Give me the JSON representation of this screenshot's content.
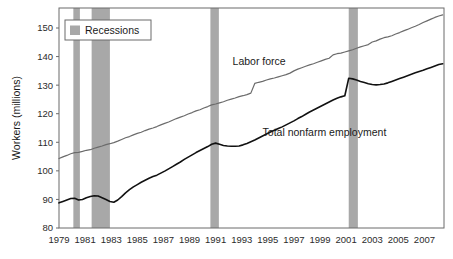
{
  "chart_data": {
    "type": "line",
    "title": "",
    "xlabel": "",
    "ylabel": "Workers (millions)",
    "xlim": [
      1979,
      2008.5
    ],
    "ylim": [
      80,
      157
    ],
    "grid": false,
    "legend_position": "top-left",
    "x_ticks": [
      "1979",
      "1981",
      "1983",
      "1985",
      "1987",
      "1989",
      "1991",
      "1993",
      "1995",
      "1997",
      "1999",
      "2001",
      "2003",
      "2005",
      "2007"
    ],
    "x_tick_values": [
      1979,
      1981,
      1983,
      1985,
      1987,
      1989,
      1991,
      1993,
      1995,
      1997,
      1999,
      2001,
      2003,
      2005,
      2007
    ],
    "y_ticks": [
      "80",
      "90",
      "100",
      "110",
      "120",
      "130",
      "140",
      "150"
    ],
    "y_tick_values": [
      80,
      90,
      100,
      110,
      120,
      130,
      140,
      150
    ],
    "legend": [
      {
        "label": "Recessions",
        "color": "#a8a8a8",
        "swatch": "band"
      }
    ],
    "annotations": [
      {
        "text": "Labor force",
        "x": 1992.3,
        "y": 137.0,
        "anchor": "start"
      },
      {
        "text": "Total nonfarm employment",
        "x": 1994.6,
        "y": 112.2,
        "anchor": "start"
      }
    ],
    "recession_bands": [
      {
        "start": 1980.1,
        "end": 1980.6
      },
      {
        "start": 1981.5,
        "end": 1982.9
      },
      {
        "start": 1990.6,
        "end": 1991.25
      },
      {
        "start": 2001.2,
        "end": 2001.9
      }
    ],
    "series": [
      {
        "name": "Labor force",
        "color": "#6b6b6b",
        "width": 1.2,
        "x": [
          1979.0,
          1979.3,
          1979.6,
          1979.9,
          1980.2,
          1980.5,
          1980.8,
          1981.1,
          1981.4,
          1981.7,
          1982.0,
          1982.3,
          1982.6,
          1982.9,
          1983.2,
          1983.5,
          1983.8,
          1984.1,
          1984.4,
          1984.7,
          1985.0,
          1985.3,
          1985.6,
          1985.9,
          1986.2,
          1986.5,
          1986.8,
          1987.1,
          1987.4,
          1987.7,
          1988.0,
          1988.3,
          1988.6,
          1988.9,
          1989.2,
          1989.5,
          1989.8,
          1990.1,
          1990.4,
          1990.7,
          1991.0,
          1991.3,
          1991.6,
          1991.9,
          1992.2,
          1992.5,
          1992.8,
          1993.1,
          1993.4,
          1993.7,
          1994.0,
          1994.3,
          1994.6,
          1994.9,
          1995.2,
          1995.5,
          1995.8,
          1996.1,
          1996.4,
          1996.7,
          1997.0,
          1997.3,
          1997.6,
          1997.9,
          1998.2,
          1998.5,
          1998.8,
          1999.1,
          1999.4,
          1999.7,
          2000.0,
          2000.3,
          2000.6,
          2000.9,
          2001.2,
          2001.5,
          2001.8,
          2002.1,
          2002.4,
          2002.7,
          2003.0,
          2003.3,
          2003.6,
          2003.9,
          2004.2,
          2004.5,
          2004.8,
          2005.1,
          2005.4,
          2005.7,
          2006.0,
          2006.3,
          2006.6,
          2006.9,
          2007.2,
          2007.5,
          2007.8,
          2008.1,
          2008.4
        ],
        "y": [
          104.3,
          104.9,
          105.4,
          106.0,
          106.4,
          106.5,
          106.8,
          107.2,
          107.4,
          107.9,
          108.3,
          108.7,
          109.2,
          109.5,
          109.9,
          110.4,
          111.0,
          111.6,
          112.0,
          112.6,
          113.1,
          113.5,
          114.1,
          114.6,
          115.0,
          115.5,
          116.1,
          116.6,
          117.1,
          117.7,
          118.3,
          118.8,
          119.3,
          119.9,
          120.4,
          121.0,
          121.4,
          122.0,
          122.5,
          123.1,
          123.4,
          123.8,
          124.2,
          124.7,
          125.1,
          125.5,
          126.0,
          126.3,
          126.7,
          127.2,
          130.6,
          131.0,
          131.3,
          131.8,
          132.2,
          132.5,
          132.9,
          133.3,
          133.7,
          134.2,
          135.0,
          135.6,
          136.1,
          136.6,
          137.1,
          137.5,
          138.0,
          138.5,
          139.0,
          139.4,
          140.6,
          141.0,
          141.2,
          141.6,
          142.0,
          142.4,
          142.9,
          143.4,
          143.8,
          144.2,
          145.1,
          145.5,
          146.1,
          146.6,
          146.9,
          147.3,
          147.9,
          148.4,
          149.0,
          149.5,
          150.1,
          150.6,
          151.2,
          151.9,
          152.5,
          153.1,
          153.7,
          154.2,
          154.6
        ]
      },
      {
        "name": "Total nonfarm employment",
        "color": "#111111",
        "width": 1.6,
        "x": [
          1979.0,
          1979.3,
          1979.6,
          1979.9,
          1980.2,
          1980.5,
          1980.8,
          1981.1,
          1981.4,
          1981.7,
          1982.0,
          1982.3,
          1982.6,
          1982.9,
          1983.2,
          1983.5,
          1983.8,
          1984.1,
          1984.4,
          1984.7,
          1985.0,
          1985.3,
          1985.6,
          1985.9,
          1986.2,
          1986.5,
          1986.8,
          1987.1,
          1987.4,
          1987.7,
          1988.0,
          1988.3,
          1988.6,
          1988.9,
          1989.2,
          1989.5,
          1989.8,
          1990.1,
          1990.4,
          1990.7,
          1991.0,
          1991.3,
          1991.6,
          1991.9,
          1992.2,
          1992.5,
          1992.8,
          1993.1,
          1993.4,
          1993.7,
          1994.0,
          1994.3,
          1994.6,
          1994.9,
          1995.2,
          1995.5,
          1995.8,
          1996.1,
          1996.4,
          1996.7,
          1997.0,
          1997.3,
          1997.6,
          1997.9,
          1998.2,
          1998.5,
          1998.8,
          1999.1,
          1999.4,
          1999.7,
          2000.0,
          2000.3,
          2000.6,
          2000.9,
          2001.2,
          2001.5,
          2001.8,
          2002.1,
          2002.4,
          2002.7,
          2003.0,
          2003.3,
          2003.6,
          2003.9,
          2004.2,
          2004.5,
          2004.8,
          2005.1,
          2005.4,
          2005.7,
          2006.0,
          2006.3,
          2006.6,
          2006.9,
          2007.2,
          2007.5,
          2007.8,
          2008.1,
          2008.4
        ],
        "y": [
          88.8,
          89.3,
          89.8,
          90.3,
          90.4,
          89.8,
          90.0,
          90.6,
          91.0,
          91.3,
          91.2,
          90.6,
          90.0,
          89.3,
          89.0,
          89.8,
          91.0,
          92.3,
          93.4,
          94.4,
          95.2,
          96.0,
          96.7,
          97.4,
          98.0,
          98.5,
          99.2,
          99.9,
          100.7,
          101.5,
          102.3,
          103.1,
          104.0,
          104.8,
          105.6,
          106.4,
          107.1,
          107.8,
          108.5,
          109.3,
          109.7,
          109.3,
          108.9,
          108.7,
          108.6,
          108.6,
          108.7,
          109.1,
          109.6,
          110.2,
          110.8,
          111.5,
          112.2,
          112.9,
          113.6,
          114.2,
          114.8,
          115.4,
          116.1,
          116.8,
          117.5,
          118.3,
          119.0,
          119.8,
          120.6,
          121.3,
          122.0,
          122.7,
          123.4,
          124.1,
          124.8,
          125.4,
          125.9,
          126.3,
          132.4,
          132.2,
          131.8,
          131.3,
          130.9,
          130.5,
          130.2,
          130.1,
          130.2,
          130.4,
          130.8,
          131.3,
          131.8,
          132.3,
          132.8,
          133.3,
          133.8,
          134.3,
          134.8,
          135.2,
          135.7,
          136.2,
          136.7,
          137.2,
          137.5
        ]
      }
    ]
  },
  "plot": {
    "left": 59,
    "top": 8,
    "right": 444,
    "bottom": 228,
    "frame_color": "#6b6b6b",
    "background": "#ffffff"
  },
  "legend_box": {
    "x": 65,
    "y": 20,
    "width": 86,
    "height": 20,
    "border_color": "#6b6b6b",
    "fill": "#ffffff"
  }
}
